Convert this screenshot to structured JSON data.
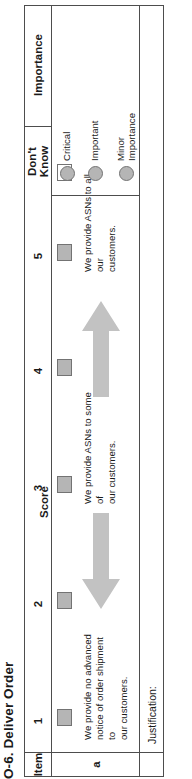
{
  "form": {
    "title": "O-6.  Deliver Order",
    "columns": {
      "item_header": "Item",
      "score_group_header": "Score",
      "dont_know_header": "Don't\nKnow",
      "importance_header": "Importance"
    },
    "scale": [
      {
        "label": "1",
        "checked": true,
        "anchor": "We provide no advanced\nnotice of order shipment to\nour customers."
      },
      {
        "label": "2",
        "checked": true,
        "anchor": ""
      },
      {
        "label": "3",
        "checked": true,
        "anchor": "We provide ASNs to some of\nour customers."
      },
      {
        "label": "4",
        "checked": true,
        "anchor": ""
      },
      {
        "label": "5",
        "checked": true,
        "anchor": "We provide ASNs to all our\ncustomers."
      }
    ],
    "dont_know": {
      "checked": false
    },
    "rows": [
      {
        "item": "a"
      }
    ],
    "justification": {
      "label": "Justification:",
      "value": ""
    },
    "importance_options": [
      {
        "label": "Critical",
        "selected": false
      },
      {
        "label": "Important",
        "selected": false
      },
      {
        "label": "Minor\nImportance",
        "selected": false
      }
    ],
    "arrows": [
      {
        "name": "arrow-down-toward-low-score",
        "direction": "down"
      },
      {
        "name": "arrow-up-toward-high-score",
        "direction": "up"
      }
    ],
    "colors": {
      "box_fill": "#b5b5b5",
      "box_border": "#737373",
      "arrow_fill": "#c2c2c2",
      "grid_line": "#4d4d4d"
    }
  }
}
